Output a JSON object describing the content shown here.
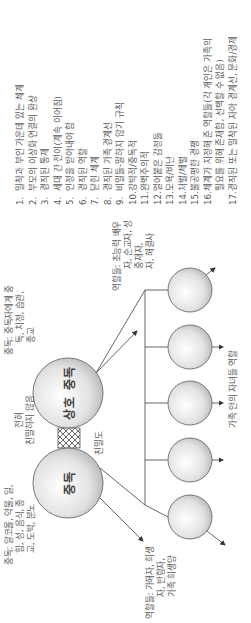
{
  "diagram": {
    "centers": {
      "co_addiction": "상호 중독",
      "addiction": "중독"
    },
    "intimacy_label": "친밀도",
    "no_intimacy_label_line1": "전혀",
    "no_intimacy_label_line2": "친밀하지 않음",
    "co_addiction_note": {
      "line1": "중독: 중독자에게 중",
      "line2": "독, 치정, 습관,",
      "line3": "종교"
    },
    "co_addiction_roles": {
      "line1": "역할들: 초능력 배우",
      "line2": "자, 순교자, 성",
      "line3": "중재자,",
      "line4": "자, 해결사"
    },
    "addiction_note": {
      "line1": "중독: 알코올, 약물, 일,",
      "line2": "힘, 성, 음식, 종",
      "line3": "교, 도박, 분노"
    },
    "addiction_roles": {
      "line1": "역할들: 가해자, 희생",
      "line2": "자, 반항자,",
      "line3": "가족 희생양"
    },
    "children_caption": "가족 안의 자녀들 역할",
    "children_count": 5
  },
  "characteristics": [
    {
      "num": "1.",
      "text": "밀착과 부인 가운데 있는 체계"
    },
    {
      "num": "2.",
      "text": "부모의 이상화 연결의 환상"
    },
    {
      "num": "3.",
      "text": "경직된 통제"
    },
    {
      "num": "4.",
      "text": "세대 간 전이(계속 이어짐)"
    },
    {
      "num": "5.",
      "text": "인정을 받아내야 함"
    },
    {
      "num": "6.",
      "text": "경직된 역할"
    },
    {
      "num": "7.",
      "text": "닫힌 체계"
    },
    {
      "num": "8.",
      "text": "경직된 가족 경계선"
    },
    {
      "num": "9.",
      "text": "비밀들-말하지 않기 규칙"
    },
    {
      "num": "10.",
      "text": "강박적/중독적"
    },
    {
      "num": "11.",
      "text": "완벽주의적"
    },
    {
      "num": "12.",
      "text": "얼어붙은 감정들"
    },
    {
      "num": "13.",
      "text": "모욕/비난"
    },
    {
      "num": "14.",
      "text": "처벌/체벌"
    },
    {
      "num": "15.",
      "text": "불공평한 경쟁"
    },
    {
      "num": "16.",
      "text": "체계가 지정해 준 역할들(각 개인은 가족의",
      "cont": "필요를 위해 존재함, 선택할 수 없음)"
    },
    {
      "num": "17.",
      "text": "경직된 또는 밀착된 자아 경계선, 문화/경제"
    }
  ]
}
